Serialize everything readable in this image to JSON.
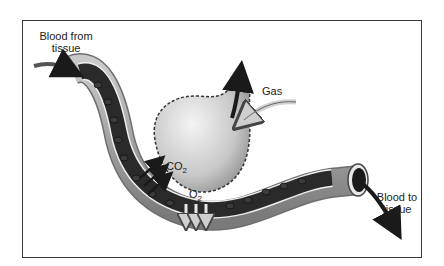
{
  "diagram": {
    "labels": {
      "blood_from_tissue": "Blood from tissue",
      "blood_to_tissue": "Blood to tissue",
      "gas": "Gas",
      "co2_main": "CO",
      "co2_sub": "2",
      "o2_main": "O",
      "o2_sub": "2"
    },
    "colors": {
      "frame": "#3a3a3a",
      "vessel_wall": "#9a9a9a",
      "vessel_lumen": "#2a2a2a",
      "alveolus": "#d8d8d8",
      "arrow": "#1a1a1a"
    }
  }
}
